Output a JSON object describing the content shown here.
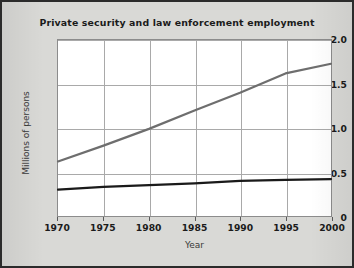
{
  "chart_data": {
    "type": "line",
    "title": "Private security and law enforcement employment",
    "xlabel": "Year",
    "ylabel": "Millions of persons",
    "x": [
      1970,
      1975,
      1980,
      1985,
      1990,
      1995,
      2000
    ],
    "xlim": [
      1970,
      2000
    ],
    "ylim": [
      0,
      2.0
    ],
    "xticks": [
      "1970",
      "1975",
      "1980",
      "1985",
      "1990",
      "1995",
      "2000"
    ],
    "yticks": [
      "0",
      "0.5",
      "1.0",
      "1.5",
      "2.0"
    ],
    "ytick_values": [
      0,
      0.5,
      1.0,
      1.5,
      2.0
    ],
    "grid": true,
    "legend": "none",
    "series": [
      {
        "name": "Private security",
        "color": "#6e6e6e",
        "values": [
          0.62,
          0.8,
          0.99,
          1.2,
          1.4,
          1.62,
          1.73
        ]
      },
      {
        "name": "Law enforcement",
        "color": "#1a1a1a",
        "values": [
          0.3,
          0.33,
          0.35,
          0.37,
          0.4,
          0.41,
          0.42
        ]
      }
    ]
  },
  "figure": {
    "background_color": "#d9d9d6",
    "plot_background_color": "#ffffff",
    "border_color": "#2b2b2b",
    "grid_color": "#a9a9a9"
  }
}
